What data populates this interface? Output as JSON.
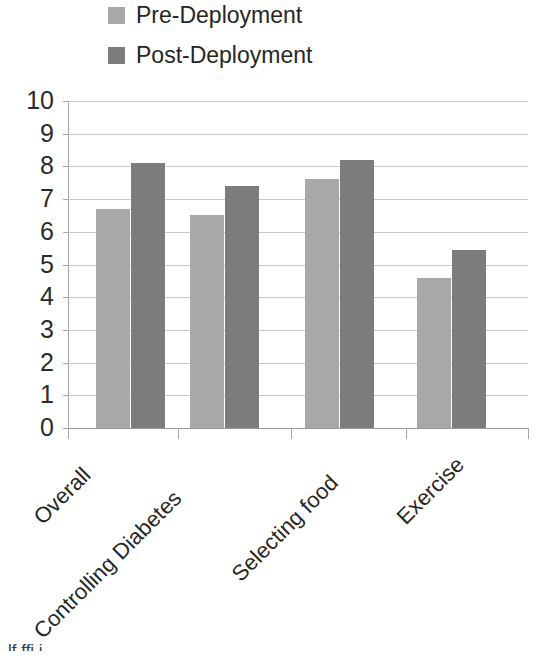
{
  "chart_data": {
    "type": "bar",
    "title": "",
    "subtitle": "",
    "xlabel": "",
    "ylabel": "",
    "ylim": [
      0,
      10
    ],
    "ytick_step": 1,
    "yticks": [
      "10",
      "9",
      "8",
      "7",
      "6",
      "5",
      "4",
      "3",
      "2",
      "1",
      "0"
    ],
    "grid": true,
    "legend_position": "top-left",
    "categories": [
      "Overall",
      "Controlling Diabetes",
      "Selecting food",
      "Exercise"
    ],
    "series": [
      {
        "name": "Pre-Deployment",
        "color": "#a8a8a8",
        "values": [
          6.7,
          6.5,
          7.6,
          4.6
        ]
      },
      {
        "name": "Post-Deployment",
        "color": "#7c7c7c",
        "values": [
          8.1,
          7.4,
          8.2,
          5.45
        ]
      }
    ]
  },
  "legend": {
    "items": [
      {
        "label": "Pre-Deployment",
        "color": "#a8a8a8",
        "swatch": "legend-swatch-pre"
      },
      {
        "label": "Post-Deployment",
        "color": "#7c7c7c",
        "swatch": "legend-swatch-post"
      }
    ]
  },
  "caption": {
    "clipped_text": "lf  ffi        i"
  }
}
